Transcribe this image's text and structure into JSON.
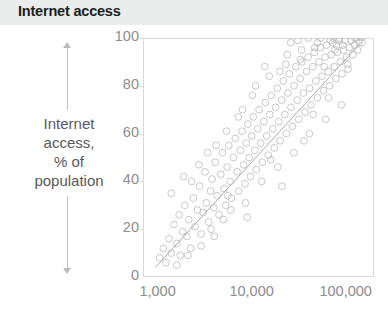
{
  "header": {
    "title": "Internet access",
    "banner_color": "#ebecec"
  },
  "axis_caption": {
    "lines": [
      "Internet",
      "access,",
      "% of",
      "population"
    ],
    "arrow_up": "arrow-up-icon",
    "arrow_down": "arrow-down-icon"
  },
  "chart_data": {
    "type": "scatter",
    "title": "Internet access",
    "xlabel": "",
    "ylabel": "Internet access, % of population",
    "xscale": "log",
    "yscale": "linear",
    "xlim": [
      700,
      200000
    ],
    "ylim": [
      0,
      100
    ],
    "grid": false,
    "legend": null,
    "marker": {
      "shape": "circle",
      "filled": false,
      "color": "#b4b5b7",
      "radius": 3.4,
      "opacity": 0.75
    },
    "xticks": [
      1000,
      10000,
      100000
    ],
    "xtick_labels": [
      "1,000",
      "10,000",
      "100,000"
    ],
    "yticks": [
      0,
      20,
      40,
      60,
      80,
      100
    ],
    "ytick_labels": [
      "0",
      "20",
      "40",
      "60",
      "80",
      "100"
    ],
    "trend_line": {
      "color": "#a9aaac",
      "width": 1,
      "x": [
        950,
        170000
      ],
      "y": [
        4,
        101
      ]
    },
    "points": [
      [
        1050,
        8
      ],
      [
        1150,
        12
      ],
      [
        1230,
        6
      ],
      [
        1320,
        16
      ],
      [
        1400,
        10
      ],
      [
        1500,
        22
      ],
      [
        1600,
        14
      ],
      [
        1700,
        26
      ],
      [
        1750,
        9
      ],
      [
        1850,
        19
      ],
      [
        1950,
        30
      ],
      [
        2050,
        17
      ],
      [
        2150,
        24
      ],
      [
        2250,
        12
      ],
      [
        2400,
        33
      ],
      [
        2500,
        21
      ],
      [
        2650,
        28
      ],
      [
        2800,
        38
      ],
      [
        2900,
        18
      ],
      [
        3050,
        27
      ],
      [
        3200,
        44
      ],
      [
        3300,
        31
      ],
      [
        3500,
        23
      ],
      [
        3650,
        36
      ],
      [
        3800,
        41
      ],
      [
        3950,
        29
      ],
      [
        4100,
        48
      ],
      [
        4300,
        34
      ],
      [
        4500,
        26
      ],
      [
        4700,
        43
      ],
      [
        4900,
        52
      ],
      [
        5100,
        37
      ],
      [
        5300,
        30
      ],
      [
        5500,
        46
      ],
      [
        5700,
        55
      ],
      [
        5900,
        40
      ],
      [
        6100,
        33
      ],
      [
        6400,
        50
      ],
      [
        6700,
        58
      ],
      [
        7000,
        44
      ],
      [
        7300,
        36
      ],
      [
        7600,
        53
      ],
      [
        7900,
        61
      ],
      [
        8200,
        47
      ],
      [
        8500,
        39
      ],
      [
        8800,
        56
      ],
      [
        9100,
        64
      ],
      [
        9400,
        50
      ],
      [
        9700,
        42
      ],
      [
        10000,
        59
      ],
      [
        10400,
        67
      ],
      [
        10800,
        53
      ],
      [
        11200,
        45
      ],
      [
        11600,
        62
      ],
      [
        12000,
        70
      ],
      [
        12500,
        56
      ],
      [
        13000,
        48
      ],
      [
        13500,
        65
      ],
      [
        14000,
        73
      ],
      [
        14500,
        59
      ],
      [
        15000,
        51
      ],
      [
        15600,
        68
      ],
      [
        16200,
        76
      ],
      [
        16800,
        62
      ],
      [
        17400,
        54
      ],
      [
        18000,
        71
      ],
      [
        18700,
        79
      ],
      [
        19400,
        65
      ],
      [
        20100,
        57
      ],
      [
        20900,
        74
      ],
      [
        21700,
        82
      ],
      [
        22500,
        68
      ],
      [
        23400,
        60
      ],
      [
        24300,
        77
      ],
      [
        25200,
        85
      ],
      [
        26200,
        71
      ],
      [
        27200,
        63
      ],
      [
        28300,
        80
      ],
      [
        29400,
        88
      ],
      [
        30500,
        74
      ],
      [
        31700,
        66
      ],
      [
        32900,
        83
      ],
      [
        34200,
        90
      ],
      [
        35500,
        77
      ],
      [
        36900,
        69
      ],
      [
        38300,
        86
      ],
      [
        39800,
        92
      ],
      [
        41300,
        79
      ],
      [
        42900,
        72
      ],
      [
        44600,
        88
      ],
      [
        46300,
        94
      ],
      [
        48100,
        82
      ],
      [
        50000,
        75
      ],
      [
        51900,
        90
      ],
      [
        53900,
        96
      ],
      [
        56000,
        84
      ],
      [
        58200,
        78
      ],
      [
        60400,
        92
      ],
      [
        62700,
        97
      ],
      [
        65100,
        86
      ],
      [
        67600,
        80
      ],
      [
        70200,
        93
      ],
      [
        72900,
        98
      ],
      [
        75700,
        88
      ],
      [
        78600,
        83
      ],
      [
        81600,
        94
      ],
      [
        84700,
        99
      ],
      [
        88000,
        90
      ],
      [
        91400,
        85
      ],
      [
        94900,
        95
      ],
      [
        98500,
        99
      ],
      [
        102000,
        92
      ],
      [
        106000,
        87
      ],
      [
        110000,
        96
      ],
      [
        115000,
        99
      ],
      [
        119000,
        93
      ],
      [
        124000,
        97
      ],
      [
        129000,
        100
      ],
      [
        134000,
        95
      ],
      [
        139000,
        98
      ],
      [
        2300,
        40
      ],
      [
        2750,
        47
      ],
      [
        3400,
        52
      ],
      [
        4200,
        55
      ],
      [
        5000,
        24
      ],
      [
        6000,
        28
      ],
      [
        7200,
        67
      ],
      [
        8600,
        31
      ],
      [
        10200,
        76
      ],
      [
        12800,
        40
      ],
      [
        15400,
        84
      ],
      [
        19000,
        46
      ],
      [
        23000,
        89
      ],
      [
        28000,
        52
      ],
      [
        34000,
        95
      ],
      [
        41000,
        60
      ],
      [
        50000,
        98
      ],
      [
        61000,
        66
      ],
      [
        74000,
        100
      ],
      [
        90000,
        72
      ],
      [
        1400,
        35
      ],
      [
        1900,
        42
      ],
      [
        3700,
        20
      ],
      [
        5400,
        61
      ],
      [
        9000,
        25
      ],
      [
        13800,
        88
      ],
      [
        21000,
        38
      ],
      [
        31000,
        99
      ],
      [
        45000,
        68
      ],
      [
        66000,
        75
      ],
      [
        1600,
        5
      ],
      [
        2100,
        9
      ],
      [
        2900,
        13
      ],
      [
        4000,
        17
      ],
      [
        5600,
        34
      ],
      [
        8000,
        70
      ],
      [
        11000,
        80
      ],
      [
        16000,
        49
      ],
      [
        24000,
        93
      ],
      [
        36000,
        57
      ],
      [
        54000,
        100
      ],
      [
        80000,
        97
      ],
      [
        105000,
        89
      ],
      [
        125000,
        100
      ],
      [
        150000,
        98
      ],
      [
        86000,
        100
      ],
      [
        93000,
        97
      ],
      [
        77000,
        95
      ],
      [
        69000,
        99
      ],
      [
        59000,
        88
      ],
      [
        47000,
        96
      ],
      [
        40000,
        100
      ],
      [
        33000,
        91
      ],
      [
        26000,
        98
      ],
      [
        20000,
        86
      ]
    ]
  }
}
